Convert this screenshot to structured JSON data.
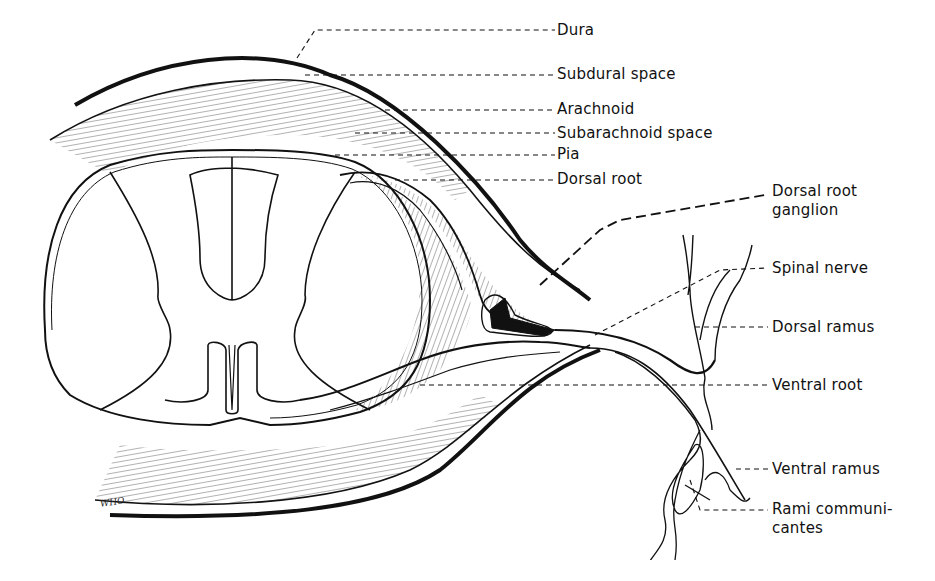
{
  "figure": {
    "artist_initials": "WHO",
    "labels": {
      "dura": "Dura",
      "subdural_space": "Subdural space",
      "arachnoid": "Arachnoid",
      "subarachnoid_space": "Subarachnoid space",
      "pia": "Pia",
      "dorsal_root": "Dorsal root",
      "dorsal_root_ganglion_line1": "Dorsal root",
      "dorsal_root_ganglion_line2": "ganglion",
      "spinal_nerve": "Spinal nerve",
      "dorsal_ramus": "Dorsal ramus",
      "ventral_root": "Ventral root",
      "ventral_ramus": "Ventral ramus",
      "rami_communicantes_line1": "Rami communi-",
      "rami_communicantes_line2": "cantes"
    }
  }
}
